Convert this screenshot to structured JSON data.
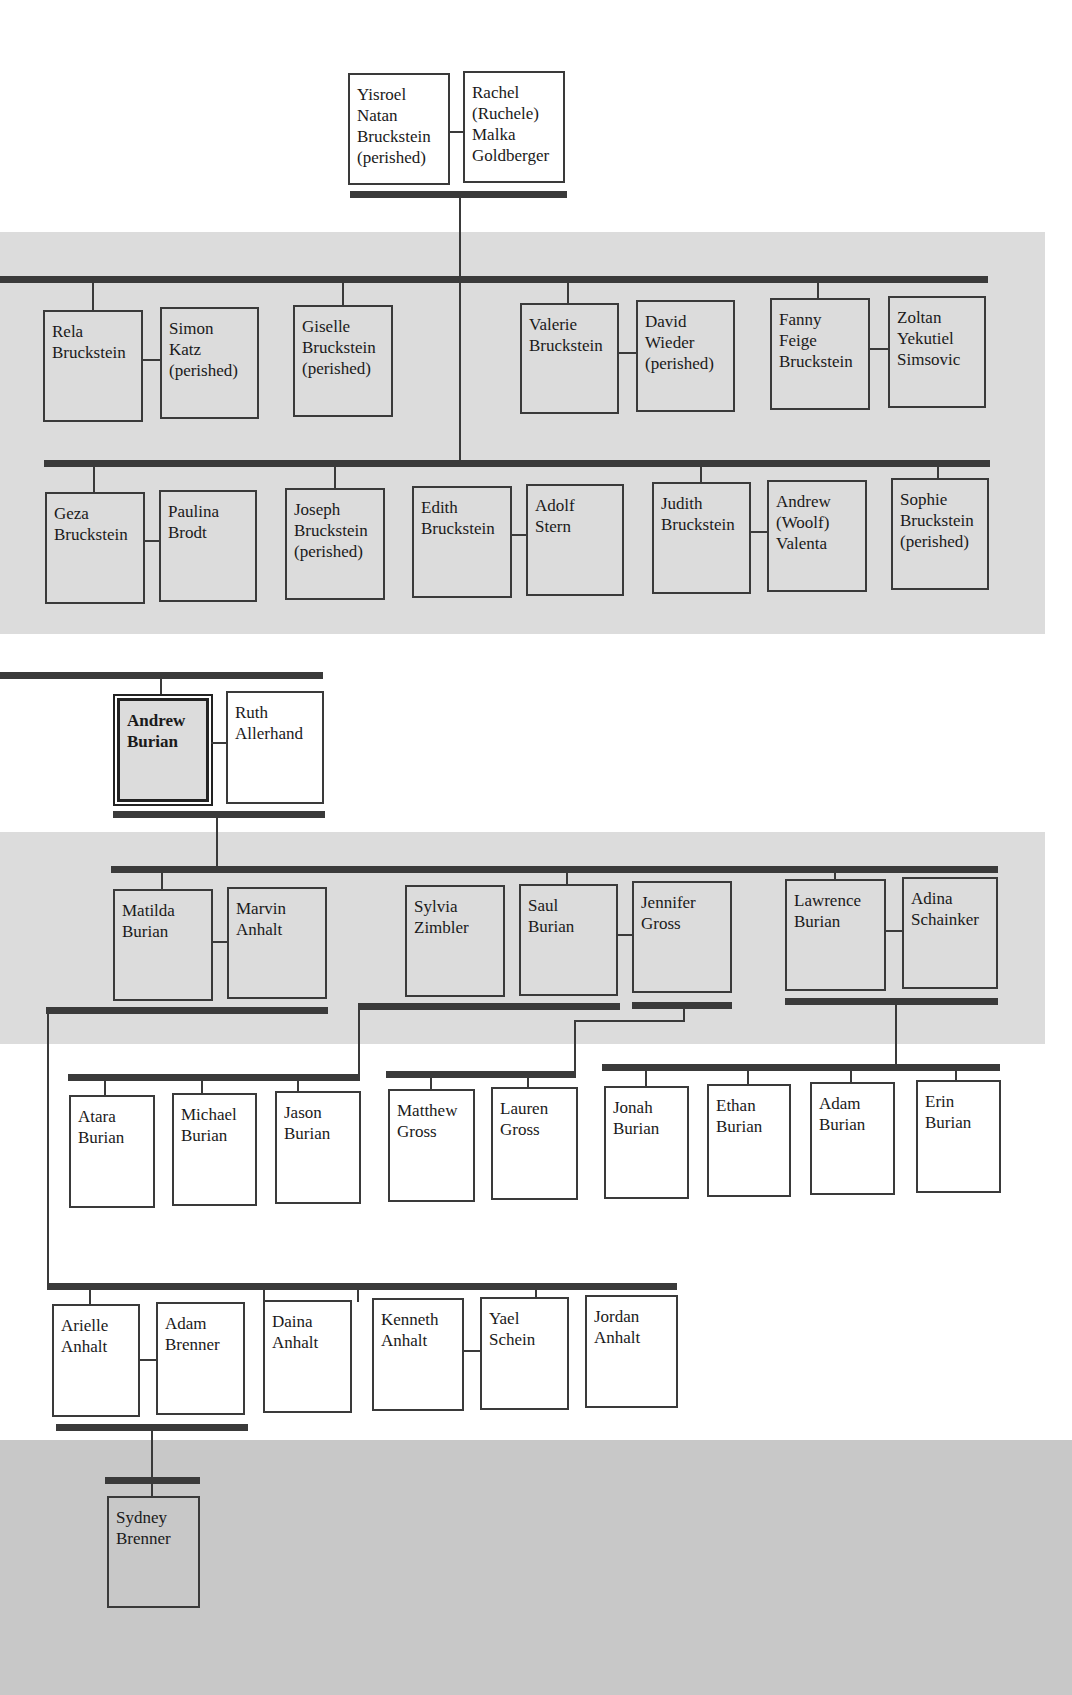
{
  "diagram": {
    "type": "family-tree",
    "colors": {
      "band": "#dcdcdc",
      "line": "#3a3a3a",
      "box_border": "#3a3a3a"
    },
    "generations": [
      {
        "level": 1,
        "couples": [
          {
            "person": "Yisroel\nNatan\nBruckstein\n(perished)",
            "spouse": "Rachel\n(Ruchele)\nMalka\nGoldberger"
          }
        ]
      },
      {
        "level": 2,
        "row_a": [
          {
            "person": "Rela\nBruckstein",
            "spouse": "Simon\nKatz\n(perished)"
          },
          {
            "person": "Giselle\nBruckstein\n(perished)"
          },
          {
            "person": "Valerie\nBruckstein",
            "spouse": "David\nWieder\n(perished)"
          },
          {
            "person": "Fanny\nFeige\nBruckstein",
            "spouse": "Zoltan\nYekutiel\nSimsovic"
          }
        ],
        "row_b": [
          {
            "person": "Geza\nBruckstein",
            "spouse": "Paulina\nBrodt"
          },
          {
            "person": "Joseph\nBruckstein\n(perished)"
          },
          {
            "person": "Edith\nBruckstein",
            "spouse": "Adolf\nStern"
          },
          {
            "person": "Judith\nBruckstein",
            "spouse": "Andrew\n(Woolf)\nValenta"
          },
          {
            "person": "Sophie\nBruckstein\n(perished)"
          }
        ]
      },
      {
        "level": 3,
        "couples": [
          {
            "person": "Andrew\nBurian",
            "spouse": "Ruth\nAllerhand",
            "highlighted": true
          }
        ]
      },
      {
        "level": 4,
        "couples": [
          {
            "person": "Matilda\nBurian",
            "spouse": "Marvin\nAnhalt"
          },
          {
            "spouse_prior": "Sylvia\nZimbler",
            "person": "Saul\nBurian",
            "spouse": "Jennifer\nGross"
          },
          {
            "person": "Lawrence\nBurian",
            "spouse": "Adina\nSchainker"
          }
        ]
      },
      {
        "level": 5,
        "groups": [
          {
            "parents": "Saul Burian & Sylvia Zimbler",
            "children": [
              "Atara\nBurian",
              "Michael\nBurian",
              "Jason\nBurian"
            ]
          },
          {
            "parents": "Saul Burian & Jennifer Gross",
            "children": [
              "Matthew\nGross",
              "Lauren\nGross"
            ]
          },
          {
            "parents": "Lawrence Burian & Adina Schainker",
            "children": [
              "Jonah\nBurian",
              "Ethan\nBurian",
              "Adam\nBurian",
              "Erin\nBurian"
            ]
          },
          {
            "parents": "Matilda Burian & Marvin Anhalt",
            "children": [
              "Arielle\nAnhalt",
              "Adam\nBrenner",
              "Daina\nAnhalt",
              "Kenneth\nAnhalt",
              "Yael\nSchein",
              "Jordan\nAnhalt"
            ]
          }
        ]
      },
      {
        "level": 6,
        "couples": [
          {
            "person": "Sydney\nBrenner"
          }
        ]
      }
    ]
  },
  "people": {
    "g1_0": "Yisroel\nNatan\nBruckstein\n(perished)",
    "g1_1": "Rachel\n(Ruchele)\nMalka\nGoldberger",
    "g2a_0": "Rela\nBruckstein",
    "g2a_1": "Simon\nKatz\n(perished)",
    "g2a_2": "Giselle\nBruckstein\n(perished)",
    "g2a_3": "Valerie\nBruckstein",
    "g2a_4": "David\nWieder\n(perished)",
    "g2a_5": "Fanny\nFeige\nBruckstein",
    "g2a_6": "Zoltan\nYekutiel\nSimsovic",
    "g2b_0": "Geza\nBruckstein",
    "g2b_1": "Paulina\nBrodt",
    "g2b_2": "Joseph\nBruckstein\n(perished)",
    "g2b_3": "Edith\nBruckstein",
    "g2b_4": "Adolf\nStern",
    "g2b_5": "Judith\nBruckstein",
    "g2b_6": "Andrew\n(Woolf)\nValenta",
    "g2b_7": "Sophie\nBruckstein\n(perished)",
    "g3_0": "Andrew\nBurian",
    "g3_1": "Ruth\nAllerhand",
    "g4_0": "Matilda\nBurian",
    "g4_1": "Marvin\nAnhalt",
    "g4_2": "Sylvia\nZimbler",
    "g4_3": "Saul\nBurian",
    "g4_4": "Jennifer\nGross",
    "g4_5": "Lawrence\nBurian",
    "g4_6": "Adina\nSchainker",
    "g5a_0": "Atara\nBurian",
    "g5a_1": "Michael\nBurian",
    "g5a_2": "Jason\nBurian",
    "g5a_3": "Matthew\nGross",
    "g5a_4": "Lauren\nGross",
    "g5a_5": "Jonah\nBurian",
    "g5a_6": "Ethan\nBurian",
    "g5a_7": "Adam\nBurian",
    "g5a_8": "Erin\nBurian",
    "g5b_0": "Arielle\nAnhalt",
    "g5b_1": "Adam\nBrenner",
    "g5b_2": "Daina\nAnhalt",
    "g5b_3": "Kenneth\nAnhalt",
    "g5b_4": "Yael\nSchein",
    "g5b_5": "Jordan\nAnhalt",
    "g6_0": "Sydney\nBrenner"
  }
}
